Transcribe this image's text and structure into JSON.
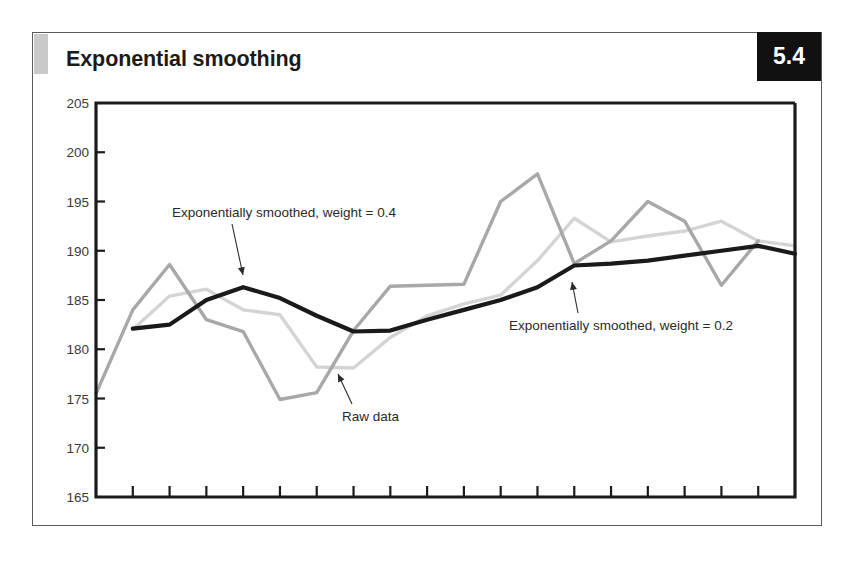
{
  "figure": {
    "title": "Exponential smoothing",
    "number": "5.4"
  },
  "colors": {
    "raw_data": "#a8a8a8",
    "smoothed_04": "#d4d4d4",
    "smoothed_02": "#1a1a1a",
    "axis": "#1b1b1b",
    "card_border": "#5b5b5b",
    "badge_background": "#111111",
    "badge_text": "#ffffff",
    "title_tab": "#c9c9c9",
    "tick_label": "#3a3a3a",
    "annotation_text": "#2a2a2a"
  },
  "annotations": [
    {
      "id": "ann-smoothed-04",
      "text": "Exponentially smoothed, weight = 0.4"
    },
    {
      "id": "ann-raw-data",
      "text": "Raw data"
    },
    {
      "id": "ann-smoothed-02",
      "text": "Exponentially smoothed, weight = 0.2"
    }
  ],
  "chart_data": {
    "type": "line",
    "title": "Exponential smoothing",
    "xlabel": "",
    "ylabel": "",
    "ylim": [
      165,
      205
    ],
    "yticks": [
      165,
      170,
      175,
      180,
      185,
      190,
      195,
      200,
      205
    ],
    "ytick_labels": [
      "165",
      "170",
      "175",
      "180",
      "185",
      "190",
      "195",
      "200",
      "205"
    ],
    "xlim": [
      0,
      19
    ],
    "x": [
      0,
      1,
      2,
      3,
      4,
      5,
      6,
      7,
      8,
      9,
      10,
      11,
      12,
      13,
      14,
      15,
      16,
      17,
      18,
      19
    ],
    "xticks_count": 20,
    "xtick_labels_shown": false,
    "grid": false,
    "legend": "annotations",
    "series": [
      {
        "name": "Raw data",
        "color": "#a8a8a8",
        "width": 3.4,
        "x": [
          0,
          1,
          2,
          3,
          4,
          5,
          6,
          7,
          8,
          9,
          10,
          11,
          12,
          13,
          14,
          15,
          16,
          17,
          18
        ],
        "values": [
          175.5,
          184.0,
          188.6,
          183.0,
          181.8,
          174.9,
          175.6,
          181.9,
          186.4,
          186.5,
          186.6,
          195.0,
          197.8,
          188.7,
          191.0,
          195.0,
          193.0,
          186.5,
          191.0
        ]
      },
      {
        "name": "Exponentially smoothed, weight = 0.4",
        "color": "#d4d4d4",
        "width": 3.4,
        "x": [
          1,
          2,
          3,
          4,
          5,
          6,
          7,
          8,
          9,
          10,
          11,
          12,
          13,
          14,
          15,
          16,
          17,
          18,
          19
        ],
        "values": [
          182.0,
          185.4,
          186.1,
          184.0,
          183.5,
          178.2,
          178.1,
          181.2,
          183.4,
          184.6,
          185.5,
          189.0,
          193.3,
          190.9,
          191.5,
          192.0,
          193.0,
          191.0,
          190.5
        ]
      },
      {
        "name": "Exponentially smoothed, weight = 0.2",
        "color": "#1a1a1a",
        "width": 4.2,
        "x": [
          1,
          2,
          3,
          4,
          5,
          6,
          7,
          8,
          9,
          10,
          11,
          12,
          13,
          14,
          15,
          16,
          17,
          18,
          19
        ],
        "values": [
          182.1,
          182.5,
          185.0,
          186.3,
          185.2,
          183.4,
          181.8,
          181.9,
          183.0,
          184.0,
          185.0,
          186.3,
          188.5,
          188.7,
          189.0,
          189.5,
          190.0,
          190.5,
          189.7
        ]
      }
    ]
  },
  "plot_geometry": {
    "left_px": 96,
    "right_px": 795,
    "top_px": 103,
    "bottom_px": 497
  }
}
